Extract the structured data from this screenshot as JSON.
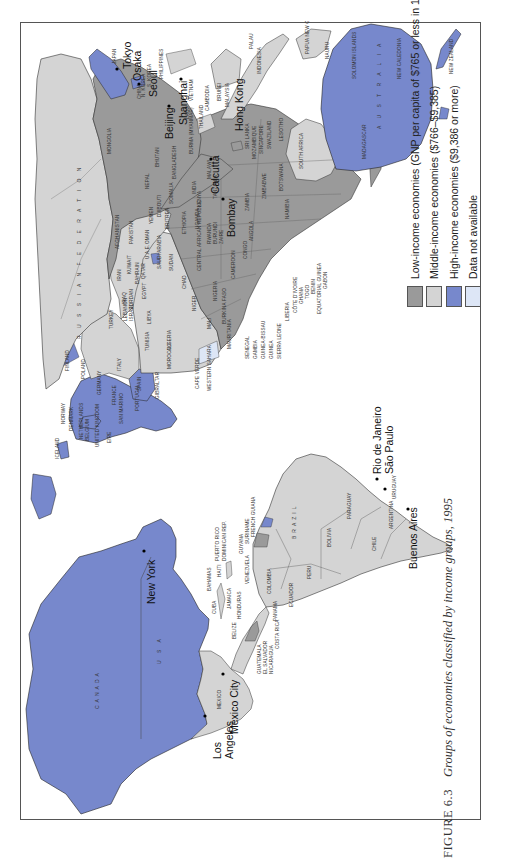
{
  "figure": {
    "number": "FIGURE 6.3",
    "title": "Groups of economies classified by income groups, 1995"
  },
  "colors": {
    "low_income": "#9a9a9a",
    "middle_income": "#d4d4d4",
    "high_income": "#7788cc",
    "data_not_available": "#dde6f6",
    "ocean": "#ffffff",
    "border": "#555555"
  },
  "legend": {
    "items": [
      {
        "key": "low_income",
        "label": "Low-income economies (GNP per capita of $765 or less in 1995)"
      },
      {
        "key": "middle_income",
        "label": "Middle-income economies ($766–$9,385)"
      },
      {
        "key": "high_income",
        "label": "High-income economies ($9,386 or more)"
      },
      {
        "key": "data_not_available",
        "label": "Data not available"
      }
    ]
  },
  "cities": {
    "los_angeles_1": "Los",
    "los_angeles_2": "Angeles",
    "mexico_city": "Mexico City",
    "new_york": "New York",
    "rio": "Rio de Janeiro",
    "sao_paulo": "São Paulo",
    "buenos_aires": "Buenos Aires",
    "bombay": "Bombay",
    "calcutta": "Calcutta",
    "beijing": "Beijing",
    "shanghai": "Shanghai",
    "hong_kong": "Hong Kong",
    "seoul": "Seoul",
    "tokyo": "Tokyo",
    "osaka": "Osaka"
  },
  "countries": {
    "canada": "CANADA",
    "usa": "U S A",
    "mexico": "MEXICO",
    "cuba": "CUBA",
    "bahamas": "BAHAMAS",
    "haiti": "HAITI",
    "puerto_rico": "PUERTO RICO",
    "dominican_rep": "DOMINICAN REP.",
    "jamaica": "JAMAICA",
    "belize": "BELIZE",
    "honduras": "HONDURAS",
    "guatemala": "GUATEMALA",
    "el_salvador": "EL SALVADOR",
    "nicaragua": "NICARAGUA",
    "costa_rica": "COSTA RICA",
    "panama": "PANAMA",
    "venezuela": "VENEZUELA",
    "guyana": "GUYANA",
    "suriname": "SURINAME",
    "french_guiana": "FRENCH GUIANA",
    "colombia": "COLOMBIA",
    "ecuador": "ECUADOR",
    "peru": "PERU",
    "brazil": "BRAZIL",
    "bolivia": "BOLIVIA",
    "paraguay": "PARAGUAY",
    "chile": "CHILE",
    "argentina": "ARGENTINA",
    "uruguay": "URUGUAY",
    "iceland": "ICELAND",
    "norway": "NORWAY",
    "denmark": "DENMARK",
    "netherlands": "NETHERLANDS",
    "belgium": "BELGIUM",
    "united_kingdom": "UNITED KINGDOM",
    "eire": "EIRE",
    "san_marino": "SAN MARINO",
    "portugal": "PORTUGAL",
    "gibraltar": "GIBRALTAR",
    "finland": "FINLAND",
    "poland": "POLAND",
    "germany": "GERMANY",
    "france": "FRANCE",
    "spain": "SPAIN",
    "italy": "ITALY",
    "turkey": "TURKEY",
    "lebanon": "LEBANON",
    "israel": "ISRAEL",
    "morocco": "MOROCCO",
    "algeria": "ALGERIA",
    "tunisia": "TUNISIA",
    "libya": "LIBYA",
    "egypt": "EGYPT",
    "cape_verde": "CAPE VERDE",
    "western_sahara": "WESTERN SAHARA",
    "mauritania": "MAURITANIA",
    "mali": "MALI",
    "niger": "NIGER",
    "chad": "CHAD",
    "sudan": "SUDAN",
    "senegal": "SENEGAL",
    "gambia": "GAMBIA",
    "guinea_bissau": "GUINEA-BISSAU",
    "guinea": "GUINEA",
    "sierra_leone": "SIERRA LEONE",
    "liberia": "LIBERIA",
    "cote_divoire": "CÔTE D'IVOIRE",
    "ghana": "GHANA",
    "togo": "TOGO",
    "benin": "BENIN",
    "equatorial_guinea": "EQUATORIAL GUINEA",
    "gabon": "GABON",
    "burkina_faso": "BURKINA FASO",
    "nigeria": "NIGERIA",
    "cameroon": "CAMEROON",
    "congo": "CONGO",
    "car": "CENTRAL AFRICAN REPUBLIC",
    "ethiopia": "ETHIOPIA",
    "eritrea": "ERITREA",
    "djibouti": "DJIBOUTI",
    "somalia": "SOMALIA",
    "yemen": "YEMEN",
    "uganda": "UGANDA",
    "kenya": "KENYA",
    "rwanda": "RWANDA",
    "burundi": "BURUNDI",
    "zaire": "ZAIRE",
    "tanzania": "TANZANIA",
    "angola": "ANGOLA",
    "zambia": "ZAMBIA",
    "malawi": "MALAWI",
    "zimbabwe": "ZIMBABWE",
    "mozambique": "MOZAMBIQUE",
    "namibia": "NAMIBIA",
    "botswana": "BOTSWANA",
    "south_africa": "SOUTH AFRICA",
    "swaziland": "SWAZILAND",
    "lesotho": "LESOTHO",
    "madagascar": "MADAGASCAR",
    "russia": "R U S S I A N   F E D E R A T I O N",
    "iraq": "IRAQ",
    "iran": "IRAN",
    "jordan": "JORDAN",
    "kuwait": "KUWAIT",
    "bahrain": "BAHRAIN",
    "qatar": "QATAR",
    "uae": "U.A.E.",
    "saudi_arabia": "SAUDI ARABIA",
    "oman": "OMAN",
    "afghanistan": "AFGHANISTAN",
    "pakistan": "PAKISTAN",
    "india": "INDIA",
    "nepal": "NEPAL",
    "bhutan": "BHUTAN",
    "bangladesh": "BANGLADESH",
    "sri_lanka": "SRI LANKA",
    "mongolia": "MONGOLIA",
    "china": "CHINA",
    "burma": "BURMA (MYANMAR)",
    "laos": "LAOS",
    "thailand": "THAILAND",
    "cambodia": "CAMBODIA",
    "vietnam": "VIETNAM",
    "philippines": "PHILIPPINES",
    "brunei": "BRUNEI",
    "malaysia": "MALAYSIA",
    "singapore": "SINGAPORE",
    "indonesia": "INDONESIA",
    "palau": "PALAU",
    "n_korea": "N. KOREA",
    "s_korea": "S. KOREA",
    "japan": "JAPAN",
    "papua_new_guinea": "PAPUA NEW GUINEA",
    "solomon_islands": "SOLOMON ISLANDS",
    "nauru": "NAURU",
    "new_caledonia": "NEW CALEDONIA",
    "australia": "A U S T R A L I A",
    "new_zealand": "NEW ZEALAND"
  }
}
